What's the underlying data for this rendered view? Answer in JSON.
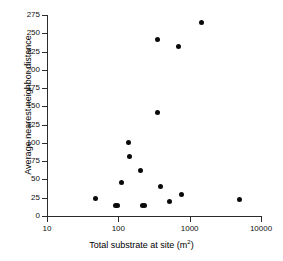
{
  "figure": {
    "background": "#ffffff",
    "marker_color": "#0a0a0a",
    "axis_color": "#2b2b2b"
  },
  "chart_data": {
    "type": "scatter",
    "title": "",
    "xlabel": "Total substrate at site (m2)",
    "xlabel_base": "Total substrate at site (m",
    "xlabel_exponent": "2",
    "xlabel_close": ")",
    "ylabel": "Average nearest neighbor distance",
    "xscale": "log",
    "yscale": "linear",
    "xlim": [
      10,
      10000
    ],
    "ylim": [
      0,
      275
    ],
    "grid": false,
    "legend": null,
    "xticks": [
      10,
      100,
      1000,
      10000
    ],
    "xtick_labels": [
      "10",
      "100",
      "1000",
      "10000"
    ],
    "yticks": [
      0,
      25,
      50,
      75,
      100,
      125,
      150,
      175,
      200,
      225,
      250,
      275
    ],
    "ytick_labels": [
      "0",
      "25",
      "50",
      "75",
      "100",
      "125",
      "150",
      "175",
      "200",
      "225",
      "250",
      "275"
    ],
    "points": [
      {
        "x": 48,
        "y": 24
      },
      {
        "x": 92,
        "y": 14
      },
      {
        "x": 97,
        "y": 14
      },
      {
        "x": 112,
        "y": 46
      },
      {
        "x": 138,
        "y": 101
      },
      {
        "x": 143,
        "y": 81
      },
      {
        "x": 205,
        "y": 62
      },
      {
        "x": 215,
        "y": 14
      },
      {
        "x": 235,
        "y": 14
      },
      {
        "x": 350,
        "y": 241
      },
      {
        "x": 354,
        "y": 142
      },
      {
        "x": 390,
        "y": 41
      },
      {
        "x": 520,
        "y": 20
      },
      {
        "x": 700,
        "y": 232
      },
      {
        "x": 760,
        "y": 30
      },
      {
        "x": 1460,
        "y": 265
      },
      {
        "x": 5000,
        "y": 22
      }
    ]
  }
}
